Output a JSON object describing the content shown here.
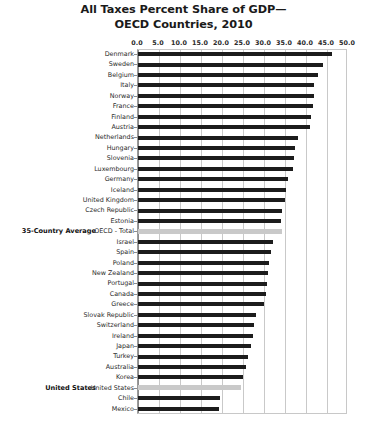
{
  "chart": {
    "title_line1": "All Taxes Percent Share of GDP—",
    "title_line2": "OECD Countries, 2010"
  },
  "chart_data": {
    "type": "bar",
    "orientation": "horizontal",
    "title": "All Taxes Percent Share of GDP— OECD Countries, 2010",
    "xlabel": "",
    "ylabel": "",
    "xlim": [
      0.0,
      50.0
    ],
    "xticks": [
      "0.0",
      "5.0",
      "10.0",
      "15.0",
      "20.0",
      "25.0",
      "30.0",
      "35.0",
      "40.0",
      "45.0",
      "50.0"
    ],
    "grid": true,
    "legend": "none",
    "bar_color": "#1c1c1c",
    "highlight_color": "#c9c9c9",
    "categories": [
      "Denmark",
      "Sweden",
      "Belgium",
      "Italy",
      "Norway",
      "France",
      "Finland",
      "Austria",
      "Netherlands",
      "Hungary",
      "Slovenia",
      "Luxembourg",
      "Germany",
      "Iceland",
      "United Kingdom",
      "Czech Republic",
      "Estonia",
      "OECD - Total",
      "Israel",
      "Spain",
      "Poland",
      "New Zealand",
      "Portugal",
      "Canada",
      "Greece",
      "Slovak Republic",
      "Switzerland",
      "Ireland",
      "Japan",
      "Turkey",
      "Australia",
      "Korea",
      "United States",
      "Chile",
      "Mexico"
    ],
    "values": [
      46.2,
      44.0,
      42.8,
      42.0,
      41.9,
      41.6,
      41.2,
      40.9,
      38.1,
      37.3,
      37.1,
      36.8,
      35.6,
      35.3,
      34.9,
      34.3,
      34.0,
      34.3,
      32.1,
      31.7,
      31.3,
      31.0,
      30.6,
      30.4,
      30.0,
      28.1,
      27.5,
      27.3,
      26.9,
      26.1,
      25.6,
      25.1,
      24.6,
      19.5,
      19.4
    ],
    "highlighted": [
      "OECD - Total",
      "United States"
    ],
    "annotations": [
      {
        "category": "OECD - Total",
        "text": "35-Country Average"
      },
      {
        "category": "United States",
        "text": "United States"
      }
    ]
  }
}
